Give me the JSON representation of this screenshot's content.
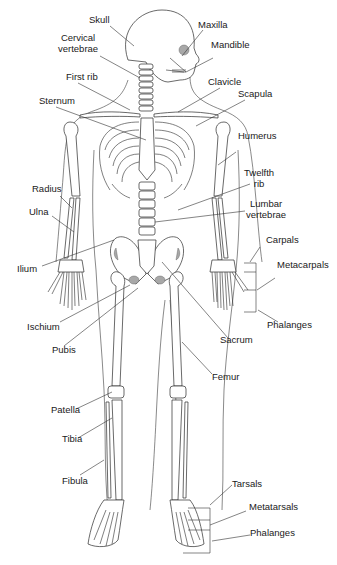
{
  "diagram": {
    "labels": {
      "skull": "Skull",
      "cervical": "Cervical\nvertebrae",
      "cervical_l1": "Cervical",
      "cervical_l2": "vertebrae",
      "first_rib": "First rib",
      "sternum": "Sternum",
      "maxilla": "Maxilla",
      "mandible": "Mandible",
      "clavicle": "Clavicle",
      "scapula": "Scapula",
      "humerus": "Humerus",
      "twelfth_rib_l1": "Twelfth",
      "twelfth_rib_l2": "rib",
      "lumbar_l1": "Lumbar",
      "lumbar_l2": "vertebrae",
      "radius": "Radius",
      "ulna": "Ulna",
      "ilium": "Ilium",
      "carpals": "Carpals",
      "metacarpals": "Metacarpals",
      "phalanges_hand": "Phalanges",
      "ischium": "Ischium",
      "pubis": "Pubis",
      "sacrum": "Sacrum",
      "femur": "Femur",
      "patella": "Patella",
      "tibia": "Tibia",
      "fibula": "Fibula",
      "tarsals": "Tarsals",
      "metatarsals": "Metatarsals",
      "phalanges_foot": "Phalanges"
    },
    "colors": {
      "line": "#2a2a2a",
      "text": "#1a1a1a",
      "shade": "#a8a8a8",
      "background": "#ffffff"
    }
  }
}
